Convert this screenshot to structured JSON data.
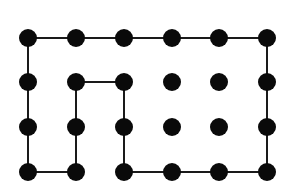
{
  "diagram": {
    "type": "dot-grid-path",
    "grid": {
      "columns": 6,
      "rows": 4
    },
    "x_positions": [
      28,
      76,
      124,
      172,
      219,
      267
    ],
    "y_positions": [
      38,
      82,
      127,
      172
    ],
    "dot_radius": 9,
    "dot_color": "#0a0a0a",
    "line_color": "#1a1a1a",
    "line_width": 2,
    "path": [
      [
        0,
        0
      ],
      [
        1,
        0
      ],
      [
        2,
        0
      ],
      [
        3,
        0
      ],
      [
        4,
        0
      ],
      [
        5,
        0
      ],
      [
        5,
        1
      ],
      [
        5,
        2
      ],
      [
        5,
        3
      ],
      [
        4,
        3
      ],
      [
        3,
        3
      ],
      [
        2,
        3
      ],
      [
        2,
        2
      ],
      [
        2,
        1
      ],
      [
        1,
        1
      ],
      [
        1,
        2
      ],
      [
        1,
        3
      ],
      [
        0,
        3
      ],
      [
        0,
        2
      ],
      [
        0,
        1
      ],
      [
        0,
        0
      ]
    ]
  }
}
